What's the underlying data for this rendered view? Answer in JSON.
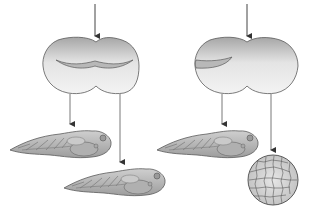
{
  "diagram": {
    "title": "",
    "colors": {
      "cell_top": "#a9a9a9",
      "cell_bottom": "#f2f2f2",
      "outline": "#5a5a5a",
      "arrow": "#444444",
      "tadpole_fill": "#bdbdbd",
      "ball_fill": "#d6d6d6"
    },
    "experiments": [
      {
        "id": "left",
        "zygote": {
          "crescent_position": "centered across both halves"
        },
        "outcomes": [
          "normal-embryo",
          "normal-embryo"
        ]
      },
      {
        "id": "right",
        "zygote": {
          "crescent_position": "entirely in left half"
        },
        "outcomes": [
          "normal-embryo",
          "undifferentiated-cell-mass"
        ]
      }
    ]
  }
}
